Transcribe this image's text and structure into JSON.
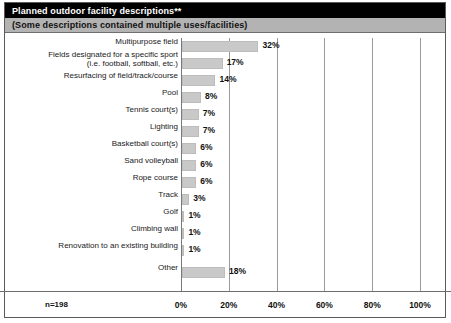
{
  "header": {
    "title": "Planned outdoor facility descriptions**",
    "subtitle": "(Some descriptions contained multiple uses/facilities)"
  },
  "footer": {
    "sample_size": "n=198"
  },
  "colors": {
    "header_bg": "#000000",
    "header_text": "#ffffff",
    "subtitle_bg": "#b3b3b3",
    "bar_fill": "#c9c9c9",
    "gridline": "#9a9a9a",
    "border": "#5a5a5a"
  },
  "chart_data": {
    "type": "bar",
    "orientation": "horizontal",
    "title": "Planned outdoor facility descriptions**",
    "subtitle": "(Some descriptions contained multiple uses/facilities)",
    "xlabel": "",
    "ylabel": "",
    "xlim": [
      0,
      100
    ],
    "xticks": [
      0,
      20,
      40,
      60,
      80,
      100
    ],
    "xtick_labels": [
      "0%",
      "20%",
      "40%",
      "60%",
      "80%",
      "100%"
    ],
    "grid": true,
    "legend": "none",
    "sample_size": 198,
    "value_suffix": "%",
    "categories": [
      "Multipurpose field",
      "Fields designated for a specific sport\n(i.e. football, softball, etc.)",
      "Resurfacing of field/track/course",
      "Pool",
      "Tennis court(s)",
      "Lighting",
      "Basketball court(s)",
      "Sand volleyball",
      "Rope course",
      "Track",
      "Golf",
      "Climbing wall",
      "Renovation to an existing building",
      "Other"
    ],
    "values": [
      32,
      17,
      14,
      8,
      7,
      7,
      6,
      6,
      6,
      3,
      1,
      1,
      1,
      18
    ],
    "value_labels": [
      "32%",
      "17%",
      "14%",
      "8%",
      "7%",
      "7%",
      "6%",
      "6%",
      "6%",
      "3%",
      "1%",
      "1%",
      "1%",
      "18%"
    ]
  }
}
